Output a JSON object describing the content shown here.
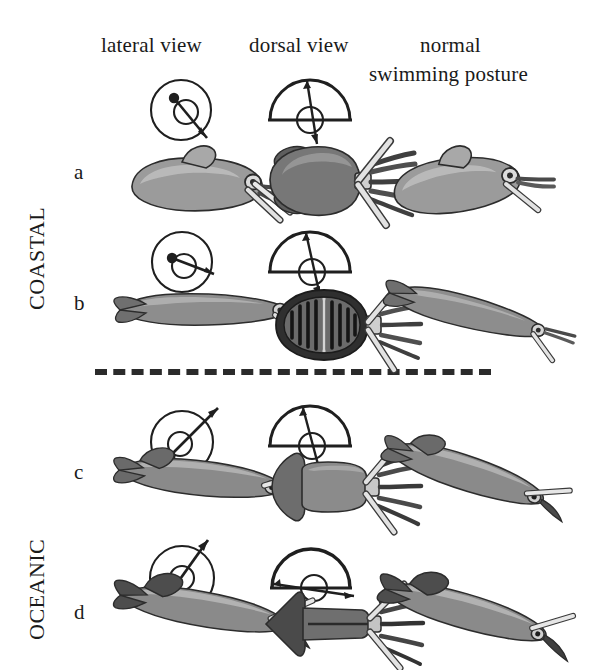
{
  "figure": {
    "type": "scientific-illustration",
    "columns": [
      {
        "id": "lateral",
        "label": "lateral view"
      },
      {
        "id": "dorsal",
        "label": "dorsal view"
      },
      {
        "id": "normal",
        "label": "normal",
        "label_line2": "swimming posture"
      }
    ],
    "groups": [
      {
        "id": "coastal",
        "label": "COASTAL",
        "rows": [
          "a",
          "b"
        ]
      },
      {
        "id": "oceanic",
        "label": "OCEANIC",
        "rows": [
          "c",
          "d"
        ]
      }
    ],
    "divider": {
      "style": "dashed",
      "between": "COASTAL and OCEANIC"
    },
    "rows": [
      {
        "letter": "a",
        "group": "coastal",
        "animal": "cuttlefish",
        "lateral_angle_deg": -55,
        "dorsal_angle_deg": -80,
        "posture_tilt_deg": -10,
        "body_shape": "broad-oval-mantle-with-fin-skirt"
      },
      {
        "letter": "b",
        "group": "coastal",
        "animal": "striped-squid",
        "lateral_angle_deg": -20,
        "dorsal_angle_deg": -78,
        "posture_tilt_deg": 14,
        "body_shape": "slender-mantle-with-transverse-bars"
      },
      {
        "letter": "c",
        "group": "oceanic",
        "animal": "oceanic-squid",
        "lateral_angle_deg": 28,
        "dorsal_angle_deg": -72,
        "posture_tilt_deg": 18,
        "body_shape": "tapered-mantle-with-terminal-fins"
      },
      {
        "letter": "d",
        "group": "oceanic",
        "animal": "arrow-squid",
        "lateral_angle_deg": 62,
        "dorsal_angle_deg": -8,
        "posture_tilt_deg": 16,
        "body_shape": "torpedo-mantle-with-large-dark-fins"
      }
    ],
    "colors": {
      "ink": "#1a1a1a",
      "body_light": "#b9b9b9",
      "body_mid": "#8e8e8e",
      "body_dark": "#5d5d5d",
      "body_darkest": "#3a3a3a",
      "arm_light": "#d8d8d8",
      "background": "#ffffff"
    }
  }
}
